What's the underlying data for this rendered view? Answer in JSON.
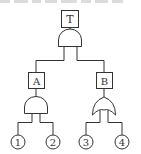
{
  "diagram": {
    "type": "fault-tree",
    "colors": {
      "stroke": "#333333",
      "background": "#ffffff",
      "cropped_text": "#dcdcdc"
    },
    "top_event": {
      "label": "T"
    },
    "top_gate": {
      "type": "AND"
    },
    "intermediate_events": [
      {
        "label": "A",
        "gate": "AND",
        "inputs": [
          "1",
          "2"
        ]
      },
      {
        "label": "B",
        "gate": "OR",
        "inputs": [
          "3",
          "4"
        ]
      }
    ],
    "basic_events": [
      {
        "label": "1"
      },
      {
        "label": "2"
      },
      {
        "label": "3"
      },
      {
        "label": "4"
      }
    ]
  }
}
